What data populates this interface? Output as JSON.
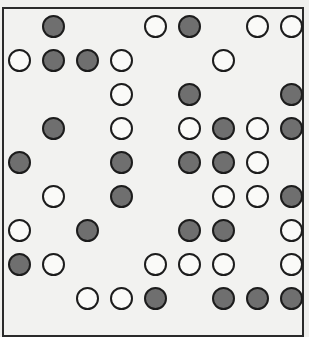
{
  "board": {
    "rows": 9,
    "cols": 9,
    "colors": {
      "white": "#fafaf8",
      "dark": "#6f6f6f",
      "outline": "#1c1c1c"
    },
    "grid": [
      [
        ".",
        "D",
        ".",
        ".",
        "W",
        "D",
        ".",
        "W",
        "W"
      ],
      [
        "W",
        "D",
        "D",
        "W",
        ".",
        ".",
        "W",
        ".",
        "."
      ],
      [
        ".",
        ".",
        ".",
        "W",
        ".",
        "D",
        ".",
        ".",
        "D"
      ],
      [
        ".",
        "D",
        ".",
        "W",
        ".",
        "W",
        "D",
        "W",
        "D"
      ],
      [
        "D",
        ".",
        ".",
        "D",
        ".",
        "D",
        "D",
        "W",
        "."
      ],
      [
        ".",
        "W",
        ".",
        "D",
        ".",
        ".",
        "W",
        "W",
        "D"
      ],
      [
        "W",
        ".",
        "D",
        ".",
        ".",
        "D",
        "D",
        ".",
        "W"
      ],
      [
        "D",
        "W",
        ".",
        ".",
        "W",
        "W",
        "W",
        ".",
        "W"
      ],
      [
        ".",
        ".",
        "W",
        "W",
        "D",
        ".",
        "D",
        "D",
        "D"
      ]
    ]
  }
}
